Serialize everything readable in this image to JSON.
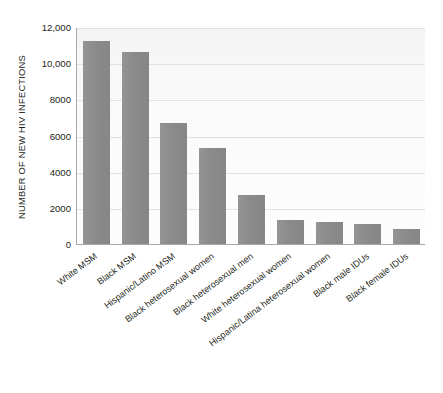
{
  "chart_data": {
    "type": "bar",
    "title": "",
    "subtitle": "",
    "xlabel": "",
    "ylabel": "NUMBER OF NEW HIV INFECTIONS",
    "ylim": [
      0,
      12000
    ],
    "ytick_labels": [
      "12,000",
      "10,000",
      "8000",
      "6000",
      "4000",
      "2000",
      "0"
    ],
    "ytick_values": [
      12000,
      10000,
      8000,
      6000,
      4000,
      2000,
      0
    ],
    "grid": true,
    "legend": "none",
    "orientation": "vertical",
    "bar_color": "#8d8d8d",
    "plot_background": "#fbfbfb",
    "gridline_color": "#e2e2e2",
    "axis_color": "#a8a8a8",
    "text_color": "#231f20",
    "categories": [
      "White MSM",
      "Black MSM",
      "Hispanic/Latino MSM",
      "Black heterosexual women",
      "Black heterosexual men",
      "White heterosexual women",
      "Hispanic/Latina heterosexual women",
      "Black male IDUs",
      "Black female IDUs"
    ],
    "values": [
      11200,
      10600,
      6700,
      5300,
      2700,
      1300,
      1200,
      1100,
      850
    ]
  }
}
